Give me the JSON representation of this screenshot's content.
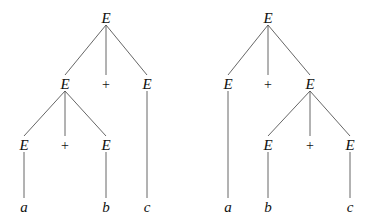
{
  "diagram": {
    "type": "parse-trees",
    "trees": [
      {
        "name": "left-associative",
        "nodes": [
          {
            "id": "L0",
            "label": "E",
            "kind": "nonterminal",
            "x": 106,
            "y": 18
          },
          {
            "id": "L1",
            "label": "E",
            "kind": "nonterminal",
            "x": 65,
            "y": 84
          },
          {
            "id": "L2",
            "label": "+",
            "kind": "operator",
            "x": 106,
            "y": 84
          },
          {
            "id": "L3",
            "label": "E",
            "kind": "nonterminal",
            "x": 147,
            "y": 84
          },
          {
            "id": "L4",
            "label": "E",
            "kind": "nonterminal",
            "x": 24,
            "y": 145
          },
          {
            "id": "L5",
            "label": "+",
            "kind": "operator",
            "x": 65,
            "y": 145
          },
          {
            "id": "L6",
            "label": "E",
            "kind": "nonterminal",
            "x": 106,
            "y": 145
          },
          {
            "id": "L7",
            "label": "a",
            "kind": "terminal",
            "x": 24,
            "y": 207
          },
          {
            "id": "L8",
            "label": "b",
            "kind": "terminal",
            "x": 106,
            "y": 207
          },
          {
            "id": "L9",
            "label": "c",
            "kind": "terminal",
            "x": 147,
            "y": 207
          }
        ],
        "edges": [
          [
            "L0",
            "L1"
          ],
          [
            "L0",
            "L2"
          ],
          [
            "L0",
            "L3"
          ],
          [
            "L1",
            "L4"
          ],
          [
            "L1",
            "L5"
          ],
          [
            "L1",
            "L6"
          ],
          [
            "L4",
            "L7"
          ],
          [
            "L6",
            "L8"
          ],
          [
            "L3",
            "L9"
          ]
        ]
      },
      {
        "name": "right-associative",
        "nodes": [
          {
            "id": "R0",
            "label": "E",
            "kind": "nonterminal",
            "x": 268,
            "y": 18
          },
          {
            "id": "R1",
            "label": "E",
            "kind": "nonterminal",
            "x": 228,
            "y": 84
          },
          {
            "id": "R2",
            "label": "+",
            "kind": "operator",
            "x": 268,
            "y": 84
          },
          {
            "id": "R3",
            "label": "E",
            "kind": "nonterminal",
            "x": 310,
            "y": 84
          },
          {
            "id": "R4",
            "label": "E",
            "kind": "nonterminal",
            "x": 268,
            "y": 145
          },
          {
            "id": "R5",
            "label": "+",
            "kind": "operator",
            "x": 310,
            "y": 145
          },
          {
            "id": "R6",
            "label": "E",
            "kind": "nonterminal",
            "x": 350,
            "y": 145
          },
          {
            "id": "R7",
            "label": "a",
            "kind": "terminal",
            "x": 228,
            "y": 207
          },
          {
            "id": "R8",
            "label": "b",
            "kind": "terminal",
            "x": 268,
            "y": 207
          },
          {
            "id": "R9",
            "label": "c",
            "kind": "terminal",
            "x": 350,
            "y": 207
          }
        ],
        "edges": [
          [
            "R0",
            "R1"
          ],
          [
            "R0",
            "R2"
          ],
          [
            "R0",
            "R3"
          ],
          [
            "R3",
            "R4"
          ],
          [
            "R3",
            "R5"
          ],
          [
            "R3",
            "R6"
          ],
          [
            "R1",
            "R7"
          ],
          [
            "R4",
            "R8"
          ],
          [
            "R6",
            "R9"
          ]
        ]
      }
    ]
  }
}
